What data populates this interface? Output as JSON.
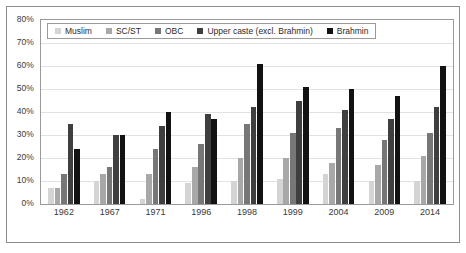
{
  "chart_data": {
    "type": "bar",
    "title": "",
    "subtitle": "",
    "xlabel": "",
    "ylabel": "",
    "ylim": [
      0,
      80
    ],
    "y_tick_labels": [
      "0%",
      "10%",
      "20%",
      "30%",
      "40%",
      "50%",
      "60%",
      "70%",
      "80%"
    ],
    "y_tick_values": [
      0,
      10,
      20,
      30,
      40,
      50,
      60,
      70,
      80
    ],
    "grid": true,
    "legend_position": "top-left-inside",
    "categories": [
      "1962",
      "1967",
      "1971",
      "1996",
      "1998",
      "1999",
      "2004",
      "2009",
      "2014"
    ],
    "series": [
      {
        "name": "Muslim",
        "color": "#d4d4d4",
        "values": [
          7,
          10,
          2,
          9,
          10,
          11,
          13,
          10,
          10
        ]
      },
      {
        "name": "SC/ST",
        "color": "#a8a8a8",
        "values": [
          7,
          13,
          13,
          16,
          20,
          20,
          18,
          17,
          21
        ]
      },
      {
        "name": "OBC",
        "color": "#777777",
        "values": [
          13,
          16,
          24,
          26,
          35,
          31,
          33,
          28,
          31
        ]
      },
      {
        "name": "Upper caste (excl. Brahmin)",
        "color": "#3f3f3f",
        "values": [
          35,
          30,
          34,
          39,
          42,
          45,
          41,
          37,
          42
        ]
      },
      {
        "name": "Brahmin",
        "color": "#121212",
        "values": [
          24,
          30,
          40,
          37,
          61,
          51,
          50,
          47,
          60
        ]
      }
    ]
  }
}
